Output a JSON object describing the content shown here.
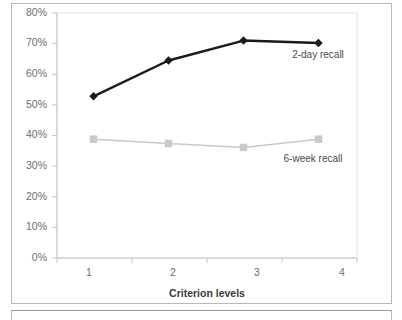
{
  "figure": {
    "caption_fragment": ""
  },
  "chart_data": {
    "type": "line",
    "title": "",
    "xlabel": "Criterion levels",
    "ylabel": "",
    "categories": [
      "1",
      "2",
      "3",
      "4"
    ],
    "x": [
      1,
      2,
      3,
      4
    ],
    "ylim": [
      0,
      80
    ],
    "yticks": [
      0,
      10,
      20,
      30,
      40,
      50,
      60,
      70,
      80
    ],
    "ytick_labels": [
      "0%",
      "10%",
      "20%",
      "30%",
      "40%",
      "50%",
      "60%",
      "70%",
      "80%"
    ],
    "xtick_labels": [
      "1",
      "2",
      "3",
      "4"
    ],
    "grid": false,
    "legend_position": "inline-annotation",
    "series": [
      {
        "name": "2-day recall",
        "label": "2-day recall",
        "color": "#1a1a1a",
        "marker": "diamond",
        "values": [
          52.8,
          64.5,
          71.0,
          70.2
        ]
      },
      {
        "name": "6-week recall",
        "label": "6-week recall",
        "color": "#c9c9c9",
        "marker": "square",
        "values": [
          38.8,
          37.4,
          36.1,
          38.8
        ]
      }
    ],
    "annotations": [
      {
        "text": "2-day recall",
        "x": 318,
        "y": 58
      },
      {
        "text": "6-week recall",
        "x": 313,
        "y": 162
      }
    ]
  }
}
